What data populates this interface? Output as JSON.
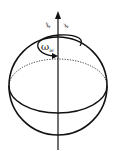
{
  "diagram": {
    "type": "earth-rotation-sphere",
    "labels": {
      "axis_e": "z",
      "axis_e_sup": "e",
      "axis_i": "z",
      "axis_i_sup": "i",
      "rotation": "ω",
      "rotation_sub": "ie"
    },
    "colors": {
      "stroke": "#111111",
      "background": "#ffffff"
    }
  }
}
